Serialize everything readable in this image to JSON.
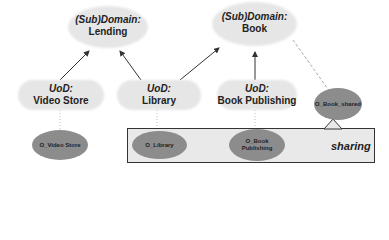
{
  "domains": [
    {
      "prefix": "(Sub)Domain:",
      "name": "Lending"
    },
    {
      "prefix": "(Sub)Domain:",
      "name": "Book"
    }
  ],
  "uods": [
    {
      "prefix": "UoD:",
      "name": "Video Store"
    },
    {
      "prefix": "UoD:",
      "name": "Library"
    },
    {
      "prefix": "UoD:",
      "name": "Book Publishing"
    }
  ],
  "ontologies": {
    "video_store": "O_Video Store",
    "library": "O_Library",
    "book_publishing_line1": "O_Book",
    "book_publishing_line2": "Publishing",
    "book_shared": "O_Book_shared"
  },
  "sharing_label": "sharing",
  "colors": {
    "cloud": "#e6e6e6",
    "ellipse": "#8c8c8c",
    "box": "#e9e9e9",
    "line": "#333333"
  }
}
